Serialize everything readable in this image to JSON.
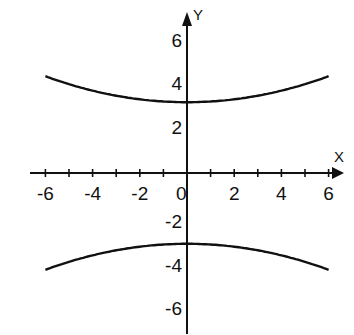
{
  "chart_data": {
    "type": "line",
    "title": "",
    "xlabel": "X",
    "ylabel": "Y",
    "xlim": [
      -6,
      6
    ],
    "ylim": [
      -7,
      7
    ],
    "grid": false,
    "legend": null,
    "x_ticks": [
      -6,
      -5,
      -4,
      -3,
      -2,
      -1,
      0,
      1,
      2,
      3,
      4,
      5,
      6
    ],
    "x_tick_labels": [
      "-6",
      "-4",
      "-2",
      "0",
      "2",
      "4",
      "6"
    ],
    "x_tick_label_values": [
      -6,
      -4,
      -2,
      0,
      2,
      4,
      6
    ],
    "y_tick_labels": [
      "6",
      "4",
      "2",
      "-2",
      "-4",
      "-6"
    ],
    "y_tick_label_values": [
      6,
      4,
      2,
      -2,
      -4,
      -6
    ],
    "equation": "y^2/9 - x^2/36 = 1",
    "series": [
      {
        "name": "upper branch",
        "x": [
          -6,
          -5,
          -4,
          -3,
          -2,
          -1,
          0,
          1,
          2,
          3,
          4,
          5,
          6
        ],
        "y": [
          4.1,
          3.85,
          3.6,
          3.35,
          3.15,
          3.02,
          3.0,
          3.02,
          3.15,
          3.35,
          3.6,
          3.85,
          4.1
        ]
      },
      {
        "name": "lower branch",
        "x": [
          -6,
          -5,
          -4,
          -3,
          -2,
          -1,
          0,
          1,
          2,
          3,
          4,
          5,
          6
        ],
        "y": [
          -4.1,
          -3.85,
          -3.6,
          -3.35,
          -3.15,
          -3.02,
          -3.0,
          -3.02,
          -3.15,
          -3.35,
          -3.6,
          -3.85,
          -4.1
        ]
      }
    ],
    "line_color": "#111111"
  },
  "axes": {
    "x_label": "X",
    "y_label": "Y",
    "origin_label": "0"
  }
}
